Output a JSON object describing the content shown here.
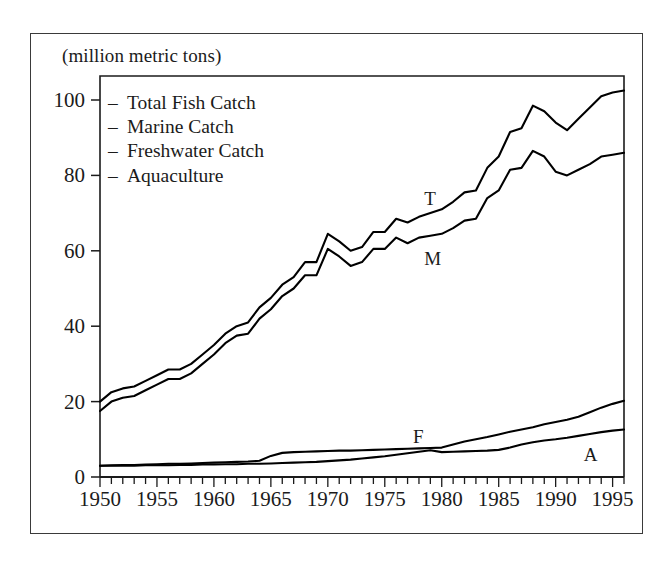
{
  "chart_data": {
    "type": "line",
    "title": "",
    "subtitle": "",
    "units_note": "(million metric tons)",
    "xlabel": "",
    "ylabel": "",
    "xlim": [
      1950,
      1996
    ],
    "ylim": [
      0,
      105
    ],
    "y_ticks": [
      0,
      20,
      40,
      60,
      80,
      100
    ],
    "y_tick_labels": [
      "0",
      "20",
      "40",
      "60",
      "80",
      "100"
    ],
    "x_ticks": [
      1950,
      1955,
      1960,
      1965,
      1970,
      1975,
      1980,
      1985,
      1990,
      1995
    ],
    "x_tick_labels": [
      "1950",
      "1955",
      "1960",
      "1965",
      "1970",
      "1975",
      "1980",
      "1985",
      "1990",
      "1995"
    ],
    "x_minor_tick_interval": 1,
    "grid": false,
    "legend_position": "upper-left-inside",
    "legend": [
      "Total Fish Catch",
      "Marine Catch",
      "Freshwater Catch",
      "Aquaculture"
    ],
    "annotations": [
      {
        "text": "T",
        "x": 1979,
        "y": 74,
        "series": "Total Fish Catch"
      },
      {
        "text": "M",
        "x": 1979,
        "y": 58,
        "series": "Marine Catch"
      },
      {
        "text": "F",
        "x": 1978,
        "y": 11,
        "series": "Freshwater Catch"
      },
      {
        "text": "A",
        "x": 1993,
        "y": 6,
        "series": "Aquaculture"
      }
    ],
    "x": [
      1950,
      1951,
      1952,
      1953,
      1954,
      1955,
      1956,
      1957,
      1958,
      1959,
      1960,
      1961,
      1962,
      1963,
      1964,
      1965,
      1966,
      1967,
      1968,
      1969,
      1970,
      1971,
      1972,
      1973,
      1974,
      1975,
      1976,
      1977,
      1978,
      1979,
      1980,
      1981,
      1982,
      1983,
      1984,
      1985,
      1986,
      1987,
      1988,
      1989,
      1990,
      1991,
      1992,
      1993,
      1994,
      1995,
      1996
    ],
    "series": [
      {
        "name": "Total Fish Catch",
        "label": "T",
        "color": "#000000",
        "values": [
          20.0,
          22.5,
          23.5,
          24.0,
          25.5,
          27.0,
          28.5,
          28.5,
          30.0,
          32.5,
          35.0,
          38.0,
          40.0,
          41.0,
          45.0,
          47.5,
          51.0,
          53.0,
          57.0,
          57.0,
          64.5,
          62.5,
          60.0,
          61.0,
          65.0,
          65.0,
          68.5,
          67.5,
          69.0,
          70.0,
          71.0,
          73.0,
          75.5,
          76.0,
          82.0,
          85.0,
          91.5,
          92.5,
          98.5,
          97.0,
          94.0,
          92.0,
          95.0,
          98.0,
          101.0,
          102.0,
          102.5
        ]
      },
      {
        "name": "Marine Catch",
        "label": "M",
        "color": "#000000",
        "values": [
          17.5,
          20.0,
          21.0,
          21.5,
          23.0,
          24.5,
          26.0,
          26.0,
          27.5,
          30.0,
          32.5,
          35.5,
          37.5,
          38.0,
          42.0,
          44.5,
          48.0,
          50.0,
          53.5,
          53.5,
          60.5,
          58.5,
          56.0,
          57.0,
          60.5,
          60.5,
          63.5,
          62.0,
          63.5,
          64.0,
          64.5,
          66.0,
          68.0,
          68.5,
          74.0,
          76.0,
          81.5,
          82.0,
          86.5,
          85.0,
          81.0,
          80.0,
          81.5,
          83.0,
          85.0,
          85.5,
          86.0
        ]
      },
      {
        "name": "Freshwater Catch",
        "label": "F",
        "color": "#000000",
        "values": [
          3.0,
          3.1,
          3.2,
          3.2,
          3.3,
          3.4,
          3.5,
          3.5,
          3.6,
          3.7,
          3.8,
          3.9,
          4.0,
          4.1,
          4.3,
          5.6,
          6.4,
          6.6,
          6.7,
          6.8,
          6.9,
          7.0,
          7.0,
          7.1,
          7.2,
          7.3,
          7.4,
          7.5,
          7.6,
          7.7,
          7.8,
          8.6,
          9.4,
          10.0,
          10.6,
          11.3,
          12.0,
          12.6,
          13.2,
          14.0,
          14.6,
          15.2,
          16.0,
          17.2,
          18.4,
          19.4,
          20.2
        ]
      },
      {
        "name": "Aquaculture",
        "label": "A",
        "color": "#000000",
        "values": [
          3.0,
          3.0,
          3.0,
          3.0,
          3.1,
          3.1,
          3.1,
          3.2,
          3.2,
          3.3,
          3.3,
          3.4,
          3.4,
          3.5,
          3.5,
          3.6,
          3.7,
          3.8,
          3.9,
          4.0,
          4.2,
          4.4,
          4.6,
          4.9,
          5.2,
          5.5,
          5.9,
          6.3,
          6.7,
          7.1,
          6.6,
          6.7,
          6.8,
          6.9,
          7.0,
          7.2,
          7.8,
          8.6,
          9.2,
          9.7,
          10.0,
          10.4,
          10.9,
          11.4,
          11.9,
          12.3,
          12.6
        ]
      }
    ]
  },
  "plot_geometry": {
    "left": 100,
    "right": 624,
    "top": 76,
    "bottom": 477
  }
}
